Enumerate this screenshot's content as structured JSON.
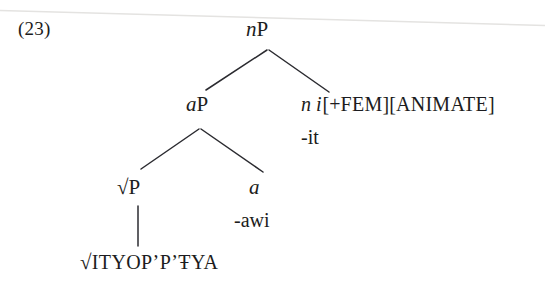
{
  "figure": {
    "example_number": "(23)",
    "type": "syntactic-tree-diagram",
    "background_color": "#ffffff",
    "ink_color": "#1c1c20",
    "scan_artifact_color": "#e3e2e0"
  },
  "tree": {
    "root": {
      "id": "nP",
      "label_italic": "n",
      "label_roman": "P",
      "label_full": "nP"
    },
    "nodes": [
      {
        "id": "aP",
        "label_italic": "a",
        "label_roman": "P",
        "label_full": "aP"
      },
      {
        "id": "n-features",
        "head_italic": "n i",
        "features": "[+FEM][ANIMATE]",
        "feature_1_sign": "+",
        "feature_1": "FEM",
        "feature_2": "ANIMATE",
        "exponent": "-it"
      },
      {
        "id": "rootP",
        "radical": "√",
        "label_roman": "P",
        "label_full": "√P"
      },
      {
        "id": "a-head",
        "label_italic": "a",
        "exponent": "-awi"
      },
      {
        "id": "root-terminal",
        "radical": "√",
        "label": "ITYOP’P’ŦYA",
        "label_full": "√ITYOP’P’ŦYA"
      }
    ],
    "branches": [
      {
        "from": "nP",
        "to": "aP",
        "kind": "diagonal-left"
      },
      {
        "from": "nP",
        "to": "n-features",
        "kind": "diagonal-right"
      },
      {
        "from": "aP",
        "to": "rootP",
        "kind": "diagonal-left"
      },
      {
        "from": "aP",
        "to": "a-head",
        "kind": "diagonal-right"
      },
      {
        "from": "rootP",
        "to": "root-terminal",
        "kind": "vertical"
      }
    ]
  }
}
